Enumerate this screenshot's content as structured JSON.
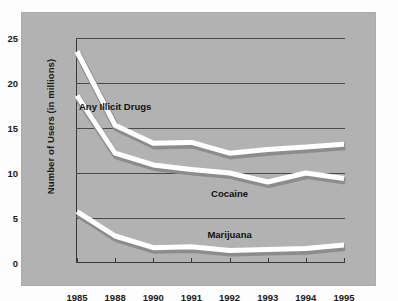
{
  "chart_data": {
    "type": "line",
    "title": "",
    "xlabel": "",
    "ylabel": "Number of Users (in millions)",
    "categories": [
      "1985",
      "1988",
      "1990",
      "1991",
      "1992",
      "1993",
      "1994",
      "1995"
    ],
    "x_ticklabels": [
      "1985",
      "1988",
      "1990",
      "1991",
      "1992",
      "1993",
      "1994",
      "1995"
    ],
    "y_ticklabels": [
      "0",
      "5",
      "10",
      "15",
      "20",
      "25"
    ],
    "y_ticks": [
      0,
      5,
      10,
      15,
      20,
      25
    ],
    "ylim": [
      0,
      25
    ],
    "grid": true,
    "legend": "inline-labels",
    "series": [
      {
        "name": "Any Illicit Drugs",
        "color": "#ffffff",
        "values": [
          23.5,
          15.3,
          13.3,
          13.4,
          12.2,
          12.6,
          12.9,
          13.2
        ],
        "label_x": "1988",
        "label_value": 17.5
      },
      {
        "name": "Cocaine",
        "color": "#ffffff",
        "values": [
          18.6,
          12.2,
          10.9,
          10.4,
          10.0,
          9.0,
          10.0,
          9.4
        ],
        "label_x": "1992",
        "label_value": 7.8
      },
      {
        "name": "Marijuana",
        "color": "#ffffff",
        "values": [
          5.7,
          3.0,
          1.7,
          1.8,
          1.4,
          1.5,
          1.6,
          2.0
        ],
        "label_x": "1992",
        "label_value": 3.2
      }
    ],
    "colors": {
      "panel_background": "#b2b2b2",
      "page_background": "#fdfdfd",
      "line": "#ffffff",
      "line_shadow": "#8c8c8c",
      "axis": "#3a3a3a",
      "gridline": "#4a4a4a",
      "text": "#1b1b1b"
    }
  }
}
